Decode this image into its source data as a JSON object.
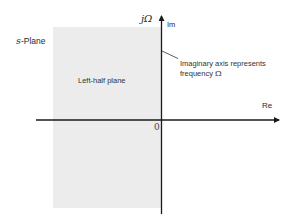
{
  "diagram": {
    "title": "s-Plane",
    "title_variable": "s",
    "title_suffix": "-Plane",
    "region_label": "Left-half plane",
    "vertical_axis": {
      "symbol": "jΩ",
      "label": "Im"
    },
    "horizontal_axis": {
      "label": "Re"
    },
    "origin_label": "0",
    "annotation": {
      "line1": "Imaginary axis represents",
      "line2_text": "frequency ",
      "line2_symbol": "Ω"
    },
    "colors": {
      "shade": "#ececec",
      "axis": "#1a1a1a",
      "text": "#2a2a2a"
    }
  }
}
